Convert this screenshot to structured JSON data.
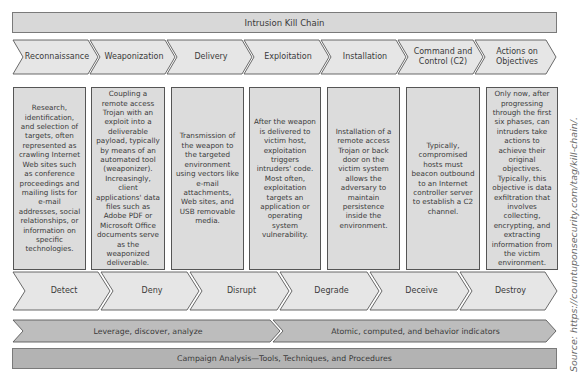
{
  "diagram": {
    "title": "Intrusion Kill Chain",
    "phases": [
      {
        "label": "Reconnaissance",
        "description": "Research, identification, and selection of targets, often represented as crawling Internet Web sites such as conference proceedings and mailing lists for e-mail addresses, social relationships, or information on specific technologies."
      },
      {
        "label": "Weaponization",
        "description": "Coupling a remote access Trojan with an exploit into a deliverable payload, typically by means of an automated tool (weaponizer). Increasingly, client applications' data files such as Adobe PDF or Microsoft Office documents serve as the weaponized deliverable."
      },
      {
        "label": "Delivery",
        "description": "Transmission of the weapon to the targeted environment using vectors like e-mail attachments, Web sites, and USB removable media."
      },
      {
        "label": "Exploitation",
        "description": "After the weapon is delivered to victim host, exploitation triggers intruders' code. Most often, exploitation targets an application or operating system vulnerability."
      },
      {
        "label": "Installation",
        "description": "Installation of a remote access Trojan or back door on the victim system allows the adversary to maintain persistence inside the environment."
      },
      {
        "label": "Command and Control (C2)",
        "description": "Typically, compromised hosts must beacon outbound to an Internet controller server to establish a C2 channel."
      },
      {
        "label": "Actions on Objectives",
        "description": "Only now, after progressing through the first six phases, can intruders take actions to achieve their original objectives. Typically, this objective is data exfiltration that involves collecting, encrypting, and extracting information from the victim environment."
      }
    ],
    "defensive_actions": [
      "Detect",
      "Deny",
      "Disrupt",
      "Degrade",
      "Deceive",
      "Destroy"
    ],
    "indicator_bands": [
      {
        "label": "Leverage, discover, analyze"
      },
      {
        "label": "Atomic, computed, and behavior indicators"
      }
    ],
    "campaign_bar": "Campaign Analysis—Tools, Techniques, and Procedures",
    "source": "Source: https://countuponsecurity.com/tag/kill-chain/.",
    "colors": {
      "light_fill": "#e6e6e6",
      "box_fill": "#dcdcdc",
      "band_fill": "#bdbdbd",
      "campaign_fill": "#b3b3b3",
      "stroke": "#5a5a5a"
    }
  }
}
